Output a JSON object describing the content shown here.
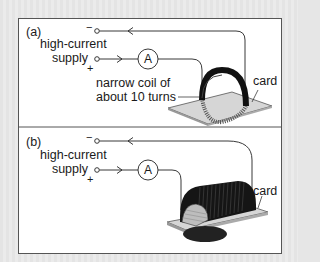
{
  "figure": {
    "background_color": "#e6e6e6",
    "panel_color": "#ffffff",
    "line_color": "#222222",
    "coil_color": "#111111",
    "card_color": "#d4d4d4"
  },
  "panel_a": {
    "label": "(a)",
    "supply_label_line1": "high-current",
    "supply_label_line2": "supply",
    "minus_sign": "−",
    "plus_sign": "+",
    "ammeter_symbol": "A",
    "coil_label_line1": "narrow coil of",
    "coil_label_line2": "about 10 turns",
    "card_label": "card"
  },
  "panel_b": {
    "label": "(b)",
    "supply_label_line1": "high-current",
    "supply_label_line2": "supply",
    "minus_sign": "−",
    "plus_sign": "+",
    "ammeter_symbol": "A",
    "card_label": "card"
  }
}
